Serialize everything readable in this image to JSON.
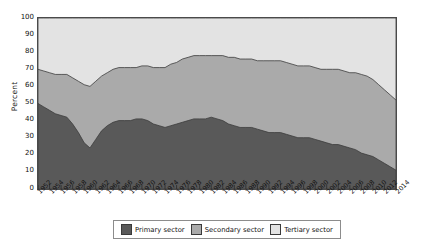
{
  "chart_data": {
    "type": "area",
    "stacked": true,
    "title": "",
    "xlabel": "",
    "ylabel": "Percent",
    "ylim": [
      0,
      100
    ],
    "yticks": [
      100,
      90,
      80,
      70,
      60,
      50,
      40,
      30,
      20,
      10,
      0
    ],
    "grid": false,
    "legend_position": "bottom",
    "x": [
      1952,
      1953,
      1954,
      1955,
      1956,
      1957,
      1958,
      1959,
      1960,
      1961,
      1962,
      1963,
      1964,
      1965,
      1966,
      1967,
      1968,
      1969,
      1970,
      1971,
      1972,
      1973,
      1974,
      1975,
      1976,
      1977,
      1978,
      1979,
      1980,
      1981,
      1982,
      1983,
      1984,
      1985,
      1986,
      1987,
      1988,
      1989,
      1990,
      1991,
      1992,
      1993,
      1994,
      1995,
      1996,
      1997,
      1998,
      1999,
      2000,
      2001,
      2002,
      2003,
      2004,
      2005,
      2006,
      2007,
      2008,
      2009,
      2010,
      2011,
      2012,
      2013,
      2014
    ],
    "xticks": [
      1952,
      1954,
      1956,
      1958,
      1960,
      1962,
      1964,
      1966,
      1968,
      1970,
      1972,
      1974,
      1976,
      1978,
      1980,
      1982,
      1984,
      1986,
      1988,
      1990,
      1992,
      1994,
      1996,
      1998,
      2000,
      2002,
      2004,
      2006,
      2008,
      2010,
      2012,
      2014
    ],
    "series": [
      {
        "name": "Primary sector",
        "color": "#595959",
        "values": [
          50,
          48,
          46,
          44,
          43,
          42,
          38,
          33,
          27,
          24,
          29,
          34,
          37,
          39,
          40,
          40,
          40,
          41,
          41,
          40,
          38,
          37,
          36,
          37,
          38,
          39,
          40,
          41,
          41,
          41,
          42,
          41,
          40,
          38,
          37,
          36,
          36,
          36,
          35,
          34,
          33,
          33,
          33,
          32,
          31,
          30,
          30,
          30,
          29,
          28,
          27,
          26,
          26,
          25,
          24,
          23,
          21,
          20,
          19,
          17,
          15,
          13,
          11
        ]
      },
      {
        "name": "Secondary sector",
        "color": "#aaaaaa",
        "values": [
          20,
          21,
          22,
          23,
          24,
          25,
          27,
          30,
          34,
          36,
          34,
          32,
          31,
          31,
          31,
          31,
          31,
          30,
          31,
          32,
          33,
          34,
          35,
          36,
          36,
          37,
          37,
          37,
          37,
          37,
          36,
          37,
          38,
          39,
          40,
          40,
          40,
          40,
          40,
          41,
          42,
          42,
          42,
          42,
          42,
          42,
          42,
          42,
          42,
          42,
          43,
          44,
          44,
          44,
          44,
          45,
          46,
          46,
          45,
          44,
          43,
          42,
          41
        ]
      },
      {
        "name": "Tertiary sector",
        "color": "#e3e3e3",
        "values": [
          30,
          31,
          32,
          33,
          33,
          33,
          35,
          37,
          39,
          40,
          37,
          34,
          32,
          30,
          29,
          29,
          29,
          29,
          28,
          28,
          29,
          29,
          29,
          27,
          26,
          24,
          23,
          22,
          22,
          22,
          22,
          22,
          22,
          23,
          23,
          24,
          24,
          24,
          25,
          25,
          25,
          25,
          25,
          26,
          27,
          28,
          28,
          28,
          29,
          30,
          30,
          30,
          30,
          31,
          32,
          32,
          33,
          34,
          36,
          39,
          42,
          45,
          48
        ]
      }
    ]
  },
  "axis": {
    "ylabel": "Percent"
  },
  "legend": {
    "items": [
      {
        "label": "Primary sector",
        "color": "#595959"
      },
      {
        "label": "Secondary sector",
        "color": "#aaaaaa"
      },
      {
        "label": "Tertiary sector",
        "color": "#e3e3e3"
      }
    ]
  }
}
